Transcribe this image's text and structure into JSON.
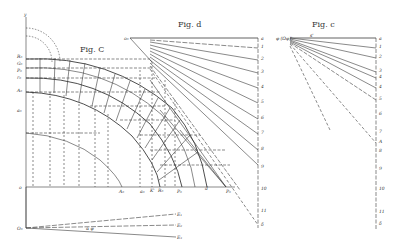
{
  "figures": {
    "fig_C": {
      "title": "Fig. C",
      "axis_labels": {
        "y_axis": "y",
        "origin": "o"
      },
      "left_labels": [
        "R₀",
        "G₀",
        "P₀",
        "r₀",
        "A₀",
        "a₀"
      ],
      "bottom_labels": [
        "A₀",
        "a₀",
        "K'",
        "R₀",
        "P₀",
        "d",
        "P₀"
      ]
    },
    "fig_d": {
      "title": "Fig. d",
      "apex_label": "o₀",
      "scale_labels": [
        "a",
        "1",
        "2",
        "3",
        "4",
        "5",
        "6",
        "7",
        "8",
        "9",
        "10",
        "11",
        "δ"
      ]
    },
    "fig_c": {
      "title": "Fig. c",
      "apex_label": "φ (Ωφ)'",
      "top_mark_label": "s'",
      "scale_labels": [
        "a",
        "1",
        "2",
        "3",
        "4",
        "4",
        "5",
        "6",
        "7",
        "A",
        "8",
        "9",
        "10",
        "11",
        "δ"
      ]
    },
    "bottom_detail": {
      "origin_label": "O₀",
      "angle_label": "α φ",
      "end_labels": [
        "E₁",
        "E₂",
        "E₃"
      ]
    }
  },
  "colors": {
    "ink": "#3a3a3a",
    "paper": "#ffffff"
  }
}
